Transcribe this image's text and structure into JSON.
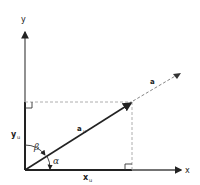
{
  "diagram": {
    "axes": {
      "x_label": "x",
      "y_label": "y"
    },
    "vectors": {
      "unit_vector_label": "a",
      "unit_vector_sub": "u",
      "extended_vector_label": "a"
    },
    "components": {
      "x_component_label": "x",
      "x_component_sub": "u",
      "y_component_label": "y",
      "y_component_sub": "u"
    },
    "angles": {
      "alpha": "α",
      "beta": "β"
    },
    "colors": {
      "line": "#222222",
      "axis": "#444444",
      "dashed": "#888888",
      "background": "#ffffff"
    }
  }
}
